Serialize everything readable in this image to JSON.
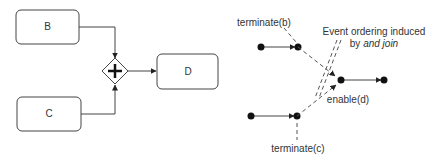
{
  "left_diagram": {
    "tasks": [
      {
        "id": "B",
        "label": "B"
      },
      {
        "id": "C",
        "label": "C"
      },
      {
        "id": "D",
        "label": "D"
      }
    ],
    "gateway": {
      "type": "parallel",
      "symbol": "+"
    }
  },
  "right_diagram": {
    "labels": {
      "terminate_b": "terminate(b)",
      "terminate_c": "terminate(c)",
      "enable_d": "enable(d)",
      "annotation_line1": "Event ordering induced",
      "annotation_line2_prefix": "by ",
      "annotation_line2_italic": "and join"
    }
  },
  "colors": {
    "stroke": "#333333",
    "node": "#111111",
    "dashed": "#555555",
    "background": "#ffffff"
  }
}
